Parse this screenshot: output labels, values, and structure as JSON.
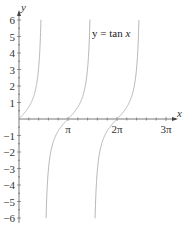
{
  "chart_data": {
    "type": "line",
    "title": "y = tan x",
    "title_parts": {
      "prefix": "y = tan ",
      "var": "x"
    },
    "xlabel": "x",
    "ylabel": "y",
    "xlim": [
      0,
      9.42
    ],
    "ylim": [
      -6,
      6
    ],
    "x_ticks": [
      {
        "value": 3.14159,
        "label": "π"
      },
      {
        "value": 6.28318,
        "label": "2π"
      },
      {
        "value": 9.42478,
        "label": "3π"
      }
    ],
    "y_ticks": [
      {
        "value": 6,
        "label": "6"
      },
      {
        "value": 5,
        "label": "5"
      },
      {
        "value": 4,
        "label": "4"
      },
      {
        "value": 3,
        "label": "3"
      },
      {
        "value": 2,
        "label": "2"
      },
      {
        "value": 1,
        "label": "1"
      },
      {
        "value": -1,
        "label": "−1"
      },
      {
        "value": -2,
        "label": "−2"
      },
      {
        "value": -3,
        "label": "−3"
      },
      {
        "value": -4,
        "label": "−4"
      },
      {
        "value": -5,
        "label": "−5"
      },
      {
        "value": -6,
        "label": "−6"
      }
    ],
    "series": [
      {
        "name": "tan x, branch 1",
        "domain": [
          0,
          1.406
        ]
      },
      {
        "name": "tan x, branch 2",
        "domain": [
          1.736,
          4.548
        ]
      },
      {
        "name": "tan x, branch 3",
        "domain": [
          4.877,
          7.689
        ]
      }
    ],
    "grid": false,
    "legend": "none",
    "curve_color": "#b0b0b0",
    "axis_color": "#555555"
  }
}
